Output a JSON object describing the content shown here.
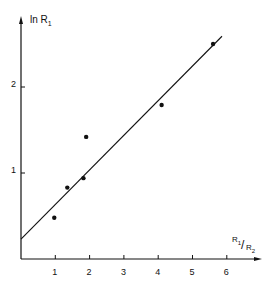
{
  "chart_data": {
    "type": "scatter",
    "title": "",
    "xlabel": "R1/R2",
    "ylabel": "ln R1",
    "xlim": [
      0,
      6.8
    ],
    "ylim": [
      0,
      2.8
    ],
    "x_ticks": [
      "1",
      "2",
      "3",
      "4",
      "5",
      "6"
    ],
    "y_ticks": [
      "1",
      "2"
    ],
    "grid": false,
    "legend": null,
    "series": [
      {
        "name": "data points",
        "type": "scatter",
        "x": [
          0.97,
          1.35,
          1.82,
          1.9,
          4.1,
          5.6
        ],
        "y": [
          0.48,
          0.83,
          0.94,
          1.42,
          1.79,
          2.5
        ]
      },
      {
        "name": "fit line",
        "type": "line",
        "x": [
          0,
          5.86
        ],
        "y": [
          0.23,
          2.59
        ]
      }
    ]
  },
  "labels": {
    "ylabel_main": "ln R",
    "ylabel_sub": "1",
    "xlabel_num": "R",
    "xlabel_num_sub": "1",
    "xlabel_den": "R",
    "xlabel_den_sub": "2",
    "x_ticks": [
      "1",
      "2",
      "3",
      "4",
      "5",
      "6"
    ],
    "y_ticks": [
      "1",
      "2"
    ]
  }
}
